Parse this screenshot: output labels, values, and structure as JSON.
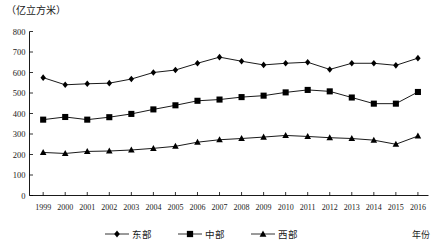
{
  "chart_data": {
    "type": "line",
    "title": "",
    "unit_label": "（亿立方米）",
    "xlabel": "年份",
    "ylabel": "",
    "ylim": [
      0,
      800
    ],
    "ytick_step": 100,
    "yticks": [
      "0",
      "100",
      "200",
      "300",
      "400",
      "500",
      "600",
      "700",
      "800"
    ],
    "grid": false,
    "legend_position": "bottom",
    "categories": [
      "1999",
      "2000",
      "2001",
      "2002",
      "2003",
      "2004",
      "2005",
      "2006",
      "2007",
      "2008",
      "2009",
      "2010",
      "2011",
      "2012",
      "2013",
      "2014",
      "2015",
      "2016"
    ],
    "series": [
      {
        "name": "东部",
        "marker": "diamond",
        "color": "#000000",
        "values": [
          575,
          540,
          545,
          548,
          568,
          600,
          612,
          645,
          675,
          655,
          637,
          645,
          650,
          615,
          645,
          645,
          635,
          670
        ]
      },
      {
        "name": "中部",
        "marker": "square",
        "color": "#000000",
        "values": [
          370,
          383,
          370,
          382,
          398,
          420,
          440,
          462,
          468,
          480,
          487,
          503,
          515,
          508,
          478,
          448,
          448,
          505
        ]
      },
      {
        "name": "西部",
        "marker": "triangle",
        "color": "#000000",
        "values": [
          210,
          205,
          215,
          217,
          222,
          230,
          240,
          260,
          272,
          278,
          285,
          293,
          288,
          282,
          278,
          270,
          250,
          290
        ]
      }
    ]
  },
  "legend": {
    "items": [
      {
        "label": "东部",
        "marker": "diamond"
      },
      {
        "label": "中部",
        "marker": "square"
      },
      {
        "label": "西部",
        "marker": "triangle"
      }
    ]
  }
}
